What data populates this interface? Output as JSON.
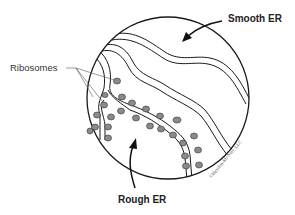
{
  "diagram": {
    "labels": {
      "smooth_er": "Smooth ER",
      "rough_er": "Rough ER",
      "ribosomes": "Ribosomes"
    },
    "copyright": "©Hayden-McNeil, LLC",
    "colors": {
      "outline": "#1a1a1a",
      "ribosome_fill": "#8a8a8a",
      "background": "#ffffff"
    }
  }
}
